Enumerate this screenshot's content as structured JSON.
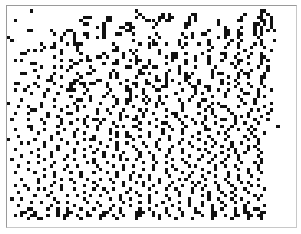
{
  "game": {
    "name": "Conway's Game of Life",
    "cols": 88,
    "rows": 67,
    "alive_color": "#111111",
    "dead_color": "#ffffff",
    "grid_rows": [
      "..........................................................................................",
      ".......X...............................X.....................................XX..........",
      "........................................X......X.X......XX..............X....X.X.........",
      ".......................XXX....XX.......X.X....XX.XX....X.X.............X....XX..X........",
      "..X...................X.......XX..........XXX.X.XX.....X.X......X.....XX.....XX.X........",
      ".......................XX....X......XX.......X........XX........X..........XX.X.X........",
      "...........................X.X....XX.XX.....X.........X...........X....X...X.X..X........",
      "......XX.....X....XX.........X......XX.......................X....XX..X....X.X.X.X.......",
      "..............X..X..X..XX....X...XX...X......X.......X..X..XX.....XX..XX...X.X...........",
      "X...............X...X...X..X.X.............X..X.......X.X.......X.X...X.....X............",
      ".X..............X...X.................X.....X.......X........X......X..X.....X...X........",
      "..........X...X...X.XXX.........X.......X..XXX..X...X.X...X..X.....X..X....X.X...........",
      "...........X.XX......X...........X.........X.........X........X...X...X...X...X..........",
      "......X.X.X.....X....X..........XX...X.X......X..............X..........X.......X.........",
      "....XX..........X.....X......X.....X..X.......X...XX..X....X.....XX...X...X..X...........",
      "..............X.........X..XX.X....X...X........X.XX.....X...X....X..X...X...XX..........",
      "..X.X...........X..X..X.XX.......X...X.XX..X......X...X..X...X...X....XX.....X.X.........",
      ".......XX...........XX.......X..XX.....X...X....X.....X......X......X.X..X...X...........",
      "..........X...X.X..X.....X..........XX...XX.XX......X....X.....X.....X......X..X.........",
      "........X.........X.......X.....X.......X........X..X.........X........X..X....X.........",
      "....XX........X......X..XX.....X.X......XX.X....X...X.X.X.....X.XX....X.XX....X..........",
      ".........X...X..X.....X........X.X.....X.....X..X.....XX......X....X..X..X...XX..........",
      "............XX......XX.....XX.......X.....X..XX.X.X...X...X......X...X.......X...........",
      "..XX....X.....X....XX.XX.XX...X...X...XX..XX....X...X..X..X......X.X..X..X...X...........",
      "......X..X......X..X...X......X.....X..X....X..XX.......XX..XX.......X....X...X..........",
      "..X..X......X.....XXX...X......X....XX...X...XX......X...X...X..X..X...X....X...X........",
      ".......X...X...X.......X......X......X...X.........X.....X.X......X.....XX..X............",
      "...........X.......X.....X...X..X....X.X..X...X.X.......X.....X...X...X.....X.X..........",
      "....X.........X......XX..X.......X..XX...X.X..X.....X..X...XX..........X...X.............",
      "X.........X.........X.......X....X..X.....X..X.X.....X....X...X.X.......X..X....X........",
      "...X..X...X...X...X..X.X........X.....X......X.......X....X..X...XX...X.......X..........",
      ".......XX.......X....X.....X..X....X....X.X.....X....X......X.X....X......X.X...X.........",
      "..X...X.....X.....XX.......X...X..X......X..X.....XX......X...X.....X....X.....X.........",
      "............X..X........X.........X.X..X.X......X..X..X.....X..X.....X.X.X...X...........",
      ".X....X...X.....X....X.X..XX.X....X...XX.....X......X...X...X....XX..X.....X...X.........",
      "...........X....X..X...X....X...X.......X..X...XX....X...X.X...X.....X..X...X............",
      "......XX.......X........X..X.....X.X..XX.....X...X....X.....X....X..X.....X.......X.......",
      "..X....X...X.....X...X.....X...X........X......X..X..X......XX.....X..X..X.X.............",
      ".........X.....X....X..X.......X.X..X......X...X.....X....X.....X.X.......X...X..........",
      "...X.........X......X.....X......X..XX..X..X.....X......X....X.....X....X..X.............",
      "X.......X....X..X......X.XX....X......X.......X..X...X....X...X...X......X..X............",
      "....X.X....X......X..X......X....X..X....X...X......X..X....X..X....X..X....X............",
      "...........X...X.........X....X..X....X...X..X....X.....X.....X..X..X....X.X.............",
      "..X......X.....X....X..X...X.....X.....X......X..X...X....X.X......X.X...X..X............",
      ".......X.....X......X.....X..X.....X....X..X.....X...X.......X...X...X..X....X...........",
      "....X....X...X....X....X.....X..X.X.....X...X...X......X...X...X...X..X.....X............",
      ".X.........X.....X..X.....X.......X.X..X....X.....X..X....X...X...X...X......X...........",
      "......X..X....X.........X.X...X..........X...X..X.....X......X...X.....X...X.X...........",
      "...X.........X....X..X.....X....X..X..X.....X.....X....X.X.....X..X..X......X............",
      "......X....X.....X..........X......X.....X..X...X..X.......X...X......X..X..X............",
      "..X.....X.....X....X..X...X...X..X....X.........X....X..X....X.....X.....X...X...........",
      "...........X..X.......X..........X...X..X..X.....X.....X...X...X...X..X...X..............",
      "....X....X......X..X....X...X..X.....X.....X..X.....X.X.....X.....X...X.....X............",
      ".........X....X.....X.....X.....X..X...X.X....X...X.....X.X....X...X...X.X...............",
      "..X..X.......X..X......X...X.......X.....X..X....X...X...X..X...X...X.....X.X............",
      "......X..X.X....X...X.....X..X..X....X.....X....X..X....X..X....X....X..X.....X..........",
      "...X.........X.........X......X.....X..X.....X......X...X....X...X..X....X...............",
      "........X...X.....X..X...X..X.....X.....X..X....X...X......X.X....X..X.....X.X...........",
      ".X..X.........X........X.......X..X..X.....X.....X.....X.....X..X...X..X....X............",
      ".......X..X....X..X.....X..X.......X....X..X...X....X..X...X.....X...X...X...............",
      "...X.........X......X.......X...X....X.......X....X....X...X..X...X.....X.....X..........",
      "......XX....X..X..X...X...X....X..X.....X..X....X...X....X....X..X...X..X..XX............",
      "....XX..X......X..XX....X....XX...X....XXX..X...X....X...XX...XX.....X..XX...XX..........",
      "..X.X..XX...X..X.XX..X..XX..XX..X..X...XX...X.X..X...X.....X..XX..X..XX..XX.XX...........",
      "......X..XX......X....X.....X....X.....X......X....X....X.....X.....X....X...X............",
      ".............................................................................................",
      "........................................................................................."
    ]
  }
}
